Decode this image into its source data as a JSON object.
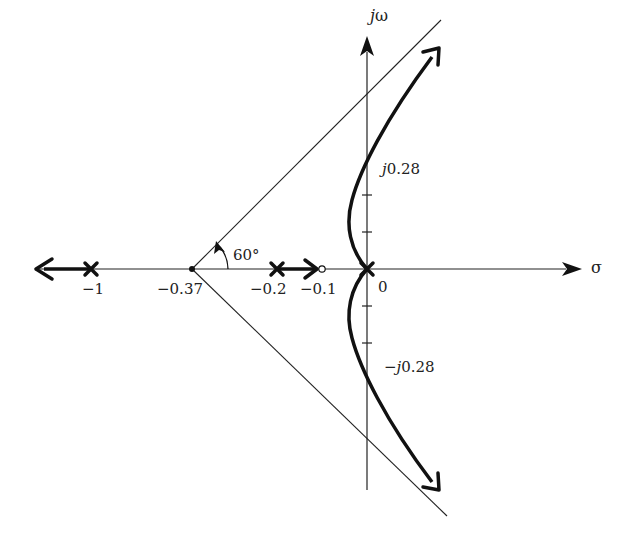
{
  "diagram": {
    "type": "root-locus",
    "axes": {
      "real_label": "σ",
      "imag_label_j": "j",
      "imag_label_w": "ω"
    },
    "poles": [
      {
        "value": -1,
        "label": "−1"
      },
      {
        "value": -0.2,
        "label": "−0.2"
      },
      {
        "value": 0,
        "label": "0",
        "multiplicity": 2
      }
    ],
    "zeros": [
      {
        "value": -0.1,
        "label": "−0.1"
      }
    ],
    "centroid": {
      "value": -0.37,
      "label": "−0.37"
    },
    "asymptote_angle": {
      "label": "60°"
    },
    "jw_crossings": {
      "upper_j": "j",
      "upper_val": "0.28",
      "lower_prefix": "−",
      "lower_j": "j",
      "lower_val": "0.28"
    },
    "colors": {
      "line": "#111111",
      "background": "#ffffff"
    }
  }
}
